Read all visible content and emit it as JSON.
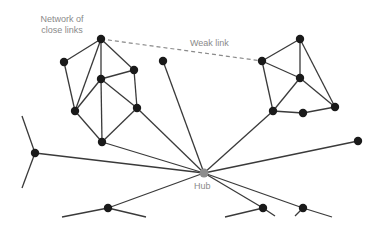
{
  "labels": {
    "network_line1": "Network of",
    "network_line2": "close links",
    "weak_link": "Weak link",
    "hub": "Hub"
  },
  "colors": {
    "node": "#1a1a1a",
    "hub": "#8c8c8c",
    "edge": "#3a3a3a",
    "label": "#8a8a8a"
  },
  "diagram": {
    "nodes": [
      {
        "id": "A",
        "x": 101,
        "y": 39
      },
      {
        "id": "B",
        "x": 64,
        "y": 62
      },
      {
        "id": "C",
        "x": 101,
        "y": 79
      },
      {
        "id": "D",
        "x": 134,
        "y": 70
      },
      {
        "id": "E",
        "x": 75,
        "y": 111
      },
      {
        "id": "F",
        "x": 137,
        "y": 108
      },
      {
        "id": "G",
        "x": 102,
        "y": 142
      },
      {
        "id": "H",
        "x": 300,
        "y": 39
      },
      {
        "id": "I",
        "x": 262,
        "y": 61
      },
      {
        "id": "J",
        "x": 300,
        "y": 78
      },
      {
        "id": "K",
        "x": 335,
        "y": 107
      },
      {
        "id": "L",
        "x": 273,
        "y": 111
      },
      {
        "id": "M",
        "x": 303,
        "y": 113
      },
      {
        "id": "N",
        "x": 163,
        "y": 61
      },
      {
        "id": "P",
        "x": 35,
        "y": 153
      },
      {
        "id": "Q",
        "x": 108,
        "y": 208
      },
      {
        "id": "R",
        "x": 263,
        "y": 208
      },
      {
        "id": "S",
        "x": 303,
        "y": 208
      },
      {
        "id": "T",
        "x": 358,
        "y": 141
      },
      {
        "id": "Hub",
        "x": 204,
        "y": 173
      }
    ],
    "edges": [
      [
        "A",
        "B"
      ],
      [
        "A",
        "E"
      ],
      [
        "A",
        "C"
      ],
      [
        "A",
        "D"
      ],
      [
        "B",
        "E"
      ],
      [
        "C",
        "D"
      ],
      [
        "C",
        "E"
      ],
      [
        "C",
        "F"
      ],
      [
        "C",
        "G"
      ],
      [
        "D",
        "F"
      ],
      [
        "E",
        "G"
      ],
      [
        "F",
        "G"
      ],
      [
        "H",
        "I"
      ],
      [
        "H",
        "J"
      ],
      [
        "H",
        "K"
      ],
      [
        "I",
        "J"
      ],
      [
        "I",
        "L"
      ],
      [
        "J",
        "L"
      ],
      [
        "J",
        "K"
      ],
      [
        "L",
        "M"
      ],
      [
        "M",
        "K"
      ],
      [
        "Hub",
        "F"
      ],
      [
        "Hub",
        "G"
      ],
      [
        "Hub",
        "P"
      ],
      [
        "Hub",
        "N"
      ],
      [
        "Hub",
        "L"
      ],
      [
        "Hub",
        "T"
      ],
      [
        "Hub",
        "Q"
      ],
      [
        "Hub",
        "R"
      ],
      [
        "Hub",
        "S"
      ]
    ],
    "weak_edges": [
      [
        "A",
        "I"
      ]
    ],
    "stubs": [
      [
        35,
        153,
        22,
        116
      ],
      [
        35,
        153,
        22,
        188
      ],
      [
        108,
        208,
        62,
        217
      ],
      [
        108,
        208,
        146,
        217
      ],
      [
        263,
        208,
        225,
        217
      ],
      [
        263,
        208,
        275,
        216
      ],
      [
        303,
        208,
        295,
        216
      ],
      [
        303,
        208,
        332,
        217
      ]
    ]
  }
}
